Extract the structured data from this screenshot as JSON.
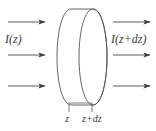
{
  "figure": {
    "type": "physics-diagram",
    "background_color": "#ffffff",
    "stroke_color": "#4a4a4a",
    "text_color": "#3b3b3b"
  },
  "labels": {
    "incident_intensity": "I(z)",
    "transmitted_intensity": "I(z+dz)",
    "position_front": "z",
    "position_back": "z+dz"
  },
  "arrows": {
    "incoming": [
      {
        "name": "incoming-arrow-top",
        "x1": 8,
        "y1": 22,
        "x2": 46,
        "y2": 22
      },
      {
        "name": "incoming-arrow-middle",
        "x1": 8,
        "y1": 55,
        "x2": 46,
        "y2": 55
      },
      {
        "name": "incoming-arrow-bottom",
        "x1": 8,
        "y1": 86,
        "x2": 46,
        "y2": 86
      }
    ],
    "outgoing": [
      {
        "name": "outgoing-arrow-top",
        "x1": 113,
        "y1": 22,
        "x2": 151,
        "y2": 22
      },
      {
        "name": "outgoing-arrow-middle",
        "x1": 113,
        "y1": 55,
        "x2": 151,
        "y2": 55
      },
      {
        "name": "outgoing-arrow-bottom",
        "x1": 113,
        "y1": 86,
        "x2": 151,
        "y2": 86
      }
    ]
  },
  "slab": {
    "name": "absorbing-slab",
    "front_face_cx": 93,
    "front_face_cy": 57,
    "front_face_rx": 14,
    "front_face_ry": 48,
    "back_face_cx": 71,
    "back_face_cy": 57,
    "back_face_rx": 14,
    "back_face_ry": 48,
    "thickness_px": 22
  },
  "ticks": {
    "front_x": 69,
    "back_x": 92,
    "top_y": 103,
    "bottom_y": 112,
    "baseline_y": 103,
    "baseline_x1": 69,
    "baseline_x2": 92
  }
}
